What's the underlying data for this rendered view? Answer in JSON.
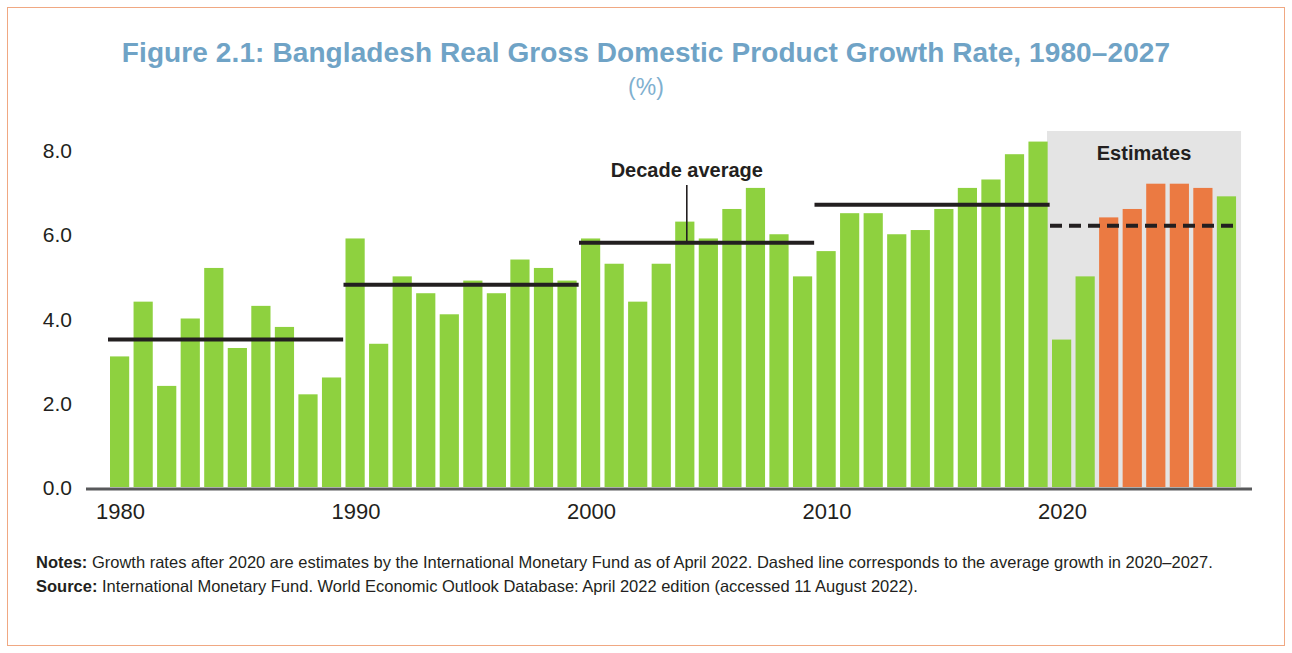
{
  "figure": {
    "title": "Figure 2.1: Bangladesh Real Gross Domestic Product Growth Rate, 1980–2027",
    "subtitle": "(%)"
  },
  "annotations": {
    "decade_average_label": "Decade average",
    "estimates_label": "Estimates"
  },
  "footer": {
    "notes_label": "Notes:",
    "notes_text": "Growth rates after 2020 are estimates by the International Monetary Fund as of April 2022. Dashed line corresponds to the average growth in 2020–2027.",
    "source_label": "Source:",
    "source_text": "International Monetary Fund. World Economic Outlook Database: April 2022 edition (accessed 11 August 2022)."
  },
  "colors": {
    "bar_actual": "#8ed13f",
    "bar_estimate": "#eb7a42",
    "title": "#6fa3c6",
    "subtitle": "#7fb0cf",
    "axis": "#58595b",
    "average_line": "#231f20",
    "estimates_band": "#e4e4e4",
    "frame_border": "#f0a882"
  },
  "chart_data": {
    "type": "bar",
    "title": "Figure 2.1: Bangladesh Real Gross Domestic Product Growth Rate, 1980–2027",
    "subtitle": "(%)",
    "xlabel": "",
    "ylabel": "(%)",
    "ylim": [
      0.0,
      8.6
    ],
    "grid": false,
    "legend": "none",
    "ytick_labels": [
      "0.0",
      "2.0",
      "4.0",
      "6.0",
      "8.0"
    ],
    "ytick_values": [
      0.0,
      2.0,
      4.0,
      6.0,
      8.0
    ],
    "xtick_labels": [
      "1980",
      "1990",
      "2000",
      "2010",
      "2020"
    ],
    "xtick_values": [
      1980,
      1990,
      2000,
      2010,
      2020
    ],
    "categories": [
      "1980",
      "1981",
      "1982",
      "1983",
      "1984",
      "1985",
      "1986",
      "1987",
      "1988",
      "1989",
      "1990",
      "1991",
      "1992",
      "1993",
      "1994",
      "1995",
      "1996",
      "1997",
      "1998",
      "1999",
      "2000",
      "2001",
      "2002",
      "2003",
      "2004",
      "2005",
      "2006",
      "2007",
      "2008",
      "2009",
      "2010",
      "2011",
      "2012",
      "2013",
      "2014",
      "2015",
      "2016",
      "2017",
      "2018",
      "2019",
      "2020",
      "2021",
      "2022",
      "2023",
      "2024",
      "2025",
      "2026",
      "2027"
    ],
    "values": [
      3.1,
      4.4,
      2.4,
      4.0,
      5.2,
      3.3,
      4.3,
      3.8,
      2.2,
      2.6,
      5.9,
      3.4,
      5.0,
      4.6,
      4.1,
      4.9,
      4.6,
      5.4,
      5.2,
      4.9,
      5.9,
      5.3,
      4.4,
      5.3,
      6.3,
      5.9,
      6.6,
      7.1,
      6.0,
      5.0,
      5.6,
      6.5,
      6.5,
      6.0,
      6.1,
      6.6,
      7.1,
      7.3,
      7.9,
      8.2,
      3.5,
      5.0,
      6.4,
      6.6,
      7.2,
      7.2,
      7.1,
      6.9
    ],
    "series_kind": [
      "actual",
      "actual",
      "actual",
      "actual",
      "actual",
      "actual",
      "actual",
      "actual",
      "actual",
      "actual",
      "actual",
      "actual",
      "actual",
      "actual",
      "actual",
      "actual",
      "actual",
      "actual",
      "actual",
      "actual",
      "actual",
      "actual",
      "actual",
      "actual",
      "actual",
      "actual",
      "actual",
      "actual",
      "actual",
      "actual",
      "actual",
      "actual",
      "actual",
      "actual",
      "actual",
      "actual",
      "actual",
      "actual",
      "actual",
      "actual",
      "actual",
      "actual",
      "estimate",
      "estimate",
      "estimate",
      "estimate",
      "estimate"
    ],
    "decade_averages": [
      {
        "label": "1980–1989",
        "start_year": 1980,
        "end_year": 1989,
        "value": 3.5,
        "style": "solid"
      },
      {
        "label": "1990–1999",
        "start_year": 1990,
        "end_year": 1999,
        "value": 4.8,
        "style": "solid"
      },
      {
        "label": "2000–2009",
        "start_year": 2000,
        "end_year": 2009,
        "value": 5.8,
        "style": "solid"
      },
      {
        "label": "2010–2019",
        "start_year": 2010,
        "end_year": 2019,
        "value": 6.7,
        "style": "solid"
      },
      {
        "label": "2020–2027",
        "start_year": 2020,
        "end_year": 2027,
        "value": 6.2,
        "style": "dashed"
      }
    ],
    "estimates_band": {
      "start_year": 2020,
      "end_year": 2027,
      "label": "Estimates"
    },
    "notes": "Growth rates after 2020 are estimates by the International Monetary Fund as of April 2022. Dashed line corresponds to the average growth in 2020–2027.",
    "source": "International Monetary Fund. World Economic Outlook Database: April 2022 edition (accessed 11 August 2022)."
  }
}
